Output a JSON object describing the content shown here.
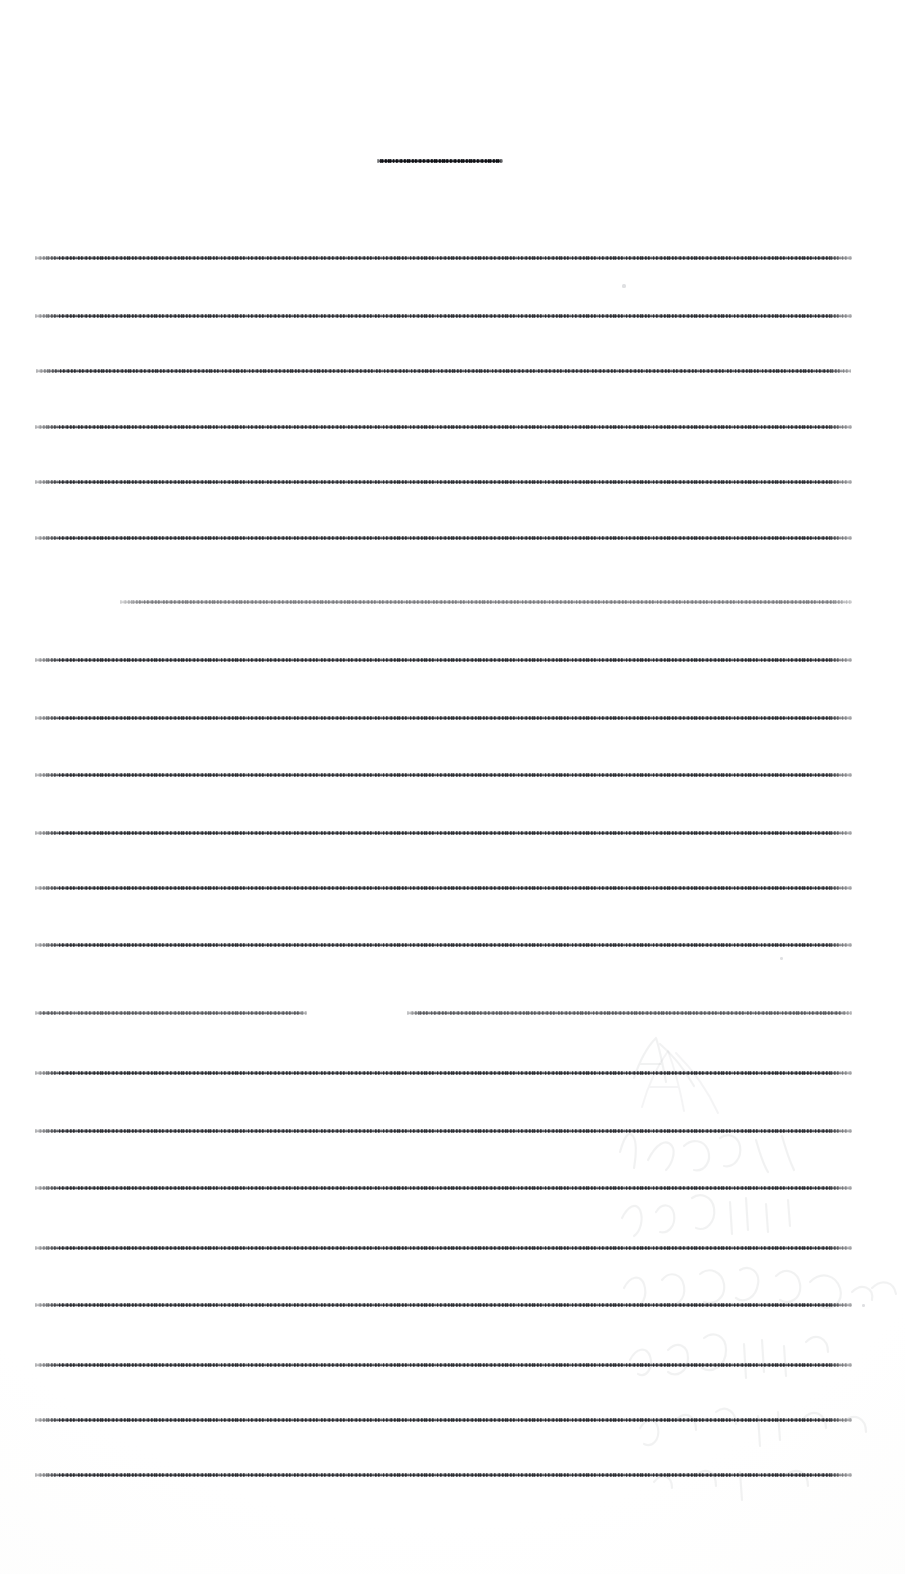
{
  "document": {
    "type": "scanned-page",
    "legibility": "illegible",
    "page_width": 905,
    "page_height": 1574,
    "background_color": "#fdfdfd",
    "ink_color": "#3a3c42",
    "ghost_color": "#9a9ca2",
    "note": "Text is degraded to thin horizontal striations; no characters are readable."
  },
  "header": {
    "line": {
      "x": 377,
      "y": 159,
      "width": 126,
      "opacity": 1
    }
  },
  "body": {
    "left_margin": 35,
    "right_margin": 852,
    "line_count": 23,
    "lines": [
      {
        "x": 35,
        "y": 256,
        "width": 817,
        "opacity": 1
      },
      {
        "x": 35,
        "y": 314,
        "width": 817,
        "opacity": 1
      },
      {
        "x": 36,
        "y": 369,
        "width": 815,
        "opacity": 1
      },
      {
        "x": 35,
        "y": 425,
        "width": 817,
        "opacity": 1
      },
      {
        "x": 35,
        "y": 480,
        "width": 817,
        "opacity": 1
      },
      {
        "x": 35,
        "y": 536,
        "width": 817,
        "opacity": 1
      },
      {
        "x": 120,
        "y": 600,
        "width": 732,
        "opacity": 0.62
      },
      {
        "x": 35,
        "y": 658,
        "width": 817,
        "opacity": 1
      },
      {
        "x": 35,
        "y": 716,
        "width": 817,
        "opacity": 1
      },
      {
        "x": 35,
        "y": 773,
        "width": 817,
        "opacity": 1
      },
      {
        "x": 35,
        "y": 831,
        "width": 817,
        "opacity": 1
      },
      {
        "x": 35,
        "y": 886,
        "width": 817,
        "opacity": 1
      },
      {
        "x": 35,
        "y": 943,
        "width": 817,
        "opacity": 1
      },
      {
        "x": 35,
        "y": 1011,
        "width": 272,
        "opacity": 0.78
      },
      {
        "x": 407,
        "y": 1011,
        "width": 445,
        "opacity": 0.78
      },
      {
        "x": 35,
        "y": 1071,
        "width": 817,
        "opacity": 1
      },
      {
        "x": 35,
        "y": 1129,
        "width": 817,
        "opacity": 1
      },
      {
        "x": 35,
        "y": 1186,
        "width": 817,
        "opacity": 1
      },
      {
        "x": 35,
        "y": 1246,
        "width": 817,
        "opacity": 1
      },
      {
        "x": 35,
        "y": 1303,
        "width": 817,
        "opacity": 1
      },
      {
        "x": 35,
        "y": 1363,
        "width": 817,
        "opacity": 1
      },
      {
        "x": 35,
        "y": 1418,
        "width": 817,
        "opacity": 1
      },
      {
        "x": 35,
        "y": 1473,
        "width": 817,
        "opacity": 1
      }
    ]
  },
  "artifacts": {
    "bleed_through": {
      "region": {
        "x": 600,
        "y": 1020,
        "width": 305,
        "height": 500
      },
      "description": "faint grey handwriting show-through from reverse side"
    },
    "specks": [
      {
        "x": 622,
        "y": 284,
        "size": 4
      },
      {
        "x": 780,
        "y": 957,
        "size": 3
      },
      {
        "x": 862,
        "y": 1304,
        "size": 3
      }
    ]
  }
}
